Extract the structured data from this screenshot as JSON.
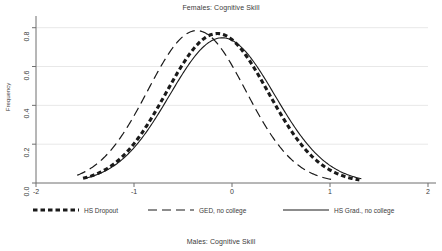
{
  "figure": {
    "top_title": "Females: Cognitive Skill",
    "bottom_caption": "Males: Cognitive Skill",
    "background_color": "#ffffff",
    "axis_color": "#6f6f6f",
    "grid_color": "#e8e8e8",
    "curve_color": "#1a1a1a"
  },
  "axes": {
    "ylabel": "Frequency",
    "xlabel": "",
    "ytick_labels": [
      "0.0",
      "0.2",
      "0.4",
      "0.6",
      "0.8"
    ],
    "xtick_labels": [
      "-2",
      "-1",
      "0",
      "1",
      "2"
    ]
  },
  "legend": {
    "items": [
      {
        "label": "HS Dropout",
        "style": "thick-dashed"
      },
      {
        "label": "GED, no college",
        "style": "long-dashed"
      },
      {
        "label": "HS Grad., no college",
        "style": "solid"
      }
    ]
  },
  "chart_data": {
    "type": "line",
    "title": "Females: Cognitive Skill",
    "subtitle": "Males: Cognitive Skill",
    "xlabel": "",
    "ylabel": "Frequency",
    "xlim": [
      -2,
      2
    ],
    "ylim": [
      0,
      0.85
    ],
    "xticks": [
      -2,
      -1,
      0,
      1,
      2
    ],
    "yticks": [
      0.0,
      0.2,
      0.4,
      0.6,
      0.8
    ],
    "grid": "horizontal",
    "legend_position": "below-axes",
    "series": [
      {
        "name": "HS Dropout",
        "style": "thick-dashed",
        "peak_x": -0.15,
        "peak_y": 0.77,
        "mean": -0.15,
        "sd": 0.52,
        "x_start": -1.52,
        "x_end": 1.3,
        "x": [
          -1.52,
          -1.4,
          -1.2,
          -1.0,
          -0.8,
          -0.6,
          -0.4,
          -0.2,
          -0.15,
          0.0,
          0.2,
          0.4,
          0.6,
          0.8,
          1.0,
          1.2,
          1.3
        ],
        "y": [
          0.015,
          0.03,
          0.08,
          0.17,
          0.31,
          0.48,
          0.64,
          0.76,
          0.77,
          0.74,
          0.63,
          0.47,
          0.3,
          0.16,
          0.07,
          0.026,
          0.015
        ]
      },
      {
        "name": "GED, no college",
        "style": "long-dashed",
        "peak_x": -0.36,
        "peak_y": 0.785,
        "mean": -0.36,
        "sd": 0.5,
        "x_start": -1.58,
        "x_end": 1.06,
        "x": [
          -1.58,
          -1.45,
          -1.25,
          -1.05,
          -0.85,
          -0.65,
          -0.45,
          -0.36,
          -0.2,
          0.0,
          0.2,
          0.4,
          0.6,
          0.8,
          1.0,
          1.06
        ],
        "y": [
          0.015,
          0.035,
          0.1,
          0.22,
          0.41,
          0.62,
          0.77,
          0.785,
          0.73,
          0.6,
          0.42,
          0.25,
          0.12,
          0.05,
          0.018,
          0.013
        ]
      },
      {
        "name": "HS Grad., no college",
        "style": "solid",
        "peak_x": -0.1,
        "peak_y": 0.748,
        "mean": -0.1,
        "sd": 0.535,
        "x_start": -1.5,
        "x_end": 1.32,
        "x": [
          -1.5,
          -1.35,
          -1.15,
          -0.95,
          -0.75,
          -0.55,
          -0.35,
          -0.15,
          -0.1,
          0.05,
          0.25,
          0.45,
          0.65,
          0.85,
          1.05,
          1.25,
          1.32
        ],
        "y": [
          0.018,
          0.035,
          0.09,
          0.18,
          0.32,
          0.49,
          0.64,
          0.74,
          0.748,
          0.73,
          0.63,
          0.48,
          0.32,
          0.18,
          0.08,
          0.03,
          0.02
        ]
      }
    ]
  }
}
